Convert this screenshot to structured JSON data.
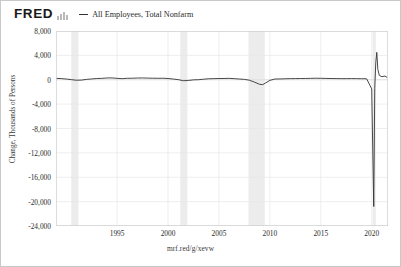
{
  "header": {
    "logo_text": "FRED",
    "logo_mark_name": "fred-bar-logo",
    "legend": [
      {
        "label": "All Employees, Total Nonfarm",
        "color": "#333333"
      }
    ]
  },
  "footer": {
    "url": "mrf.red/g/xevw"
  },
  "chart_data": {
    "type": "line",
    "title": "All Employees, Total Nonfarm",
    "xlabel": "",
    "ylabel": "Change, Thousands of Persons",
    "xlim": [
      1989.0,
      2021.6
    ],
    "ylim": [
      -24000,
      8000
    ],
    "grid": true,
    "legend_position": "top",
    "x_ticks": [
      "1995",
      "2000",
      "2005",
      "2010",
      "2015",
      "2020"
    ],
    "x_tick_values": [
      1995,
      2000,
      2005,
      2010,
      2015,
      2020
    ],
    "y_ticks": [
      "8,000",
      "4,000",
      "0",
      "-4,000",
      "-8,000",
      "-12,000",
      "-16,000",
      "-20,000",
      "-24,000"
    ],
    "y_tick_values": [
      8000,
      4000,
      0,
      -4000,
      -8000,
      -12000,
      -16000,
      -20000,
      -24000
    ],
    "line_color": "#333333",
    "recession_color": "#ececec",
    "recession_bands": [
      {
        "start": 1990.5,
        "end": 1991.2
      },
      {
        "start": 2001.2,
        "end": 2001.9
      },
      {
        "start": 2007.9,
        "end": 2009.5
      },
      {
        "start": 2020.1,
        "end": 2020.4
      }
    ],
    "series": [
      {
        "name": "All Employees, Total Nonfarm",
        "x": [
          1989.0,
          1989.5,
          1990.0,
          1990.5,
          1991.0,
          1991.5,
          1992.0,
          1992.5,
          1993.0,
          1993.5,
          1994.0,
          1994.5,
          1995.0,
          1995.5,
          1996.0,
          1996.5,
          1997.0,
          1997.5,
          1998.0,
          1998.5,
          1999.0,
          1999.5,
          2000.0,
          2000.5,
          2001.0,
          2001.5,
          2002.0,
          2002.5,
          2003.0,
          2003.5,
          2004.0,
          2004.5,
          2005.0,
          2005.5,
          2006.0,
          2006.5,
          2007.0,
          2007.5,
          2008.0,
          2008.5,
          2009.0,
          2009.3,
          2009.6,
          2010.0,
          2010.5,
          2011.0,
          2011.5,
          2012.0,
          2012.5,
          2013.0,
          2013.5,
          2014.0,
          2014.5,
          2015.0,
          2015.5,
          2016.0,
          2016.5,
          2017.0,
          2017.5,
          2018.0,
          2018.5,
          2019.0,
          2019.5,
          2020.0,
          2020.2,
          2020.3,
          2020.4,
          2020.5,
          2020.6,
          2020.75,
          2021.0,
          2021.3,
          2021.5
        ],
        "values": [
          230,
          190,
          120,
          20,
          -80,
          -60,
          60,
          130,
          200,
          230,
          290,
          300,
          230,
          180,
          240,
          250,
          280,
          290,
          270,
          250,
          240,
          250,
          200,
          120,
          20,
          -160,
          -120,
          -20,
          10,
          90,
          160,
          180,
          200,
          210,
          230,
          180,
          120,
          60,
          -80,
          -400,
          -750,
          -800,
          -500,
          -100,
          120,
          130,
          160,
          180,
          190,
          200,
          210,
          230,
          250,
          240,
          220,
          200,
          190,
          180,
          180,
          190,
          180,
          170,
          160,
          -1500,
          -20800,
          -1400,
          2800,
          4500,
          1700,
          700,
          500,
          600,
          400
        ]
      }
    ],
    "annotations": [
      {
        "label": "COVID-19 collapse",
        "x": 2020.2,
        "y": -20800
      },
      {
        "label": "COVID-19 rebound",
        "x": 2020.5,
        "y": 4500
      }
    ]
  }
}
